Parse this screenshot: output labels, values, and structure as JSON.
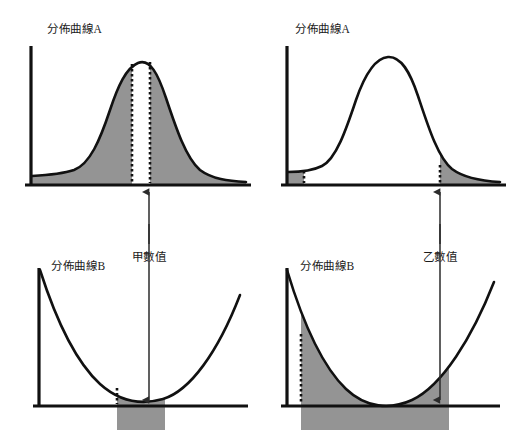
{
  "figure": {
    "background_color": "#ffffff",
    "ink_color": "#111111",
    "fill_color": "#949494",
    "panels": [
      {
        "id": "top-left",
        "title": "分佈曲線A",
        "curve_type": "bell",
        "shading": "outside-band",
        "marker_lines": 2,
        "marker_style": "dotted-full-height"
      },
      {
        "id": "top-right",
        "title": "分佈曲線A",
        "curve_type": "bell",
        "shading": "tails-only",
        "marker_lines": 2,
        "marker_style": "dotted-short"
      },
      {
        "id": "bottom-left",
        "title": "分佈曲線B",
        "curve_type": "parabola",
        "shading": "narrow-band-under-curve",
        "marker_lines": 1,
        "marker_style": "dotted-short"
      },
      {
        "id": "bottom-right",
        "title": "分佈曲線B",
        "curve_type": "parabola",
        "shading": "wide-band-under-curve",
        "marker_lines": 1,
        "marker_style": "dotted-tall"
      }
    ],
    "annotations": [
      {
        "id": "value-a",
        "label": "甲數值",
        "points_to": "top-left-panel"
      },
      {
        "id": "value-b",
        "label": "乙數值",
        "points_to": "top-right-panel"
      }
    ]
  }
}
